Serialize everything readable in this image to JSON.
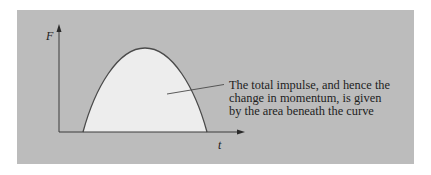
{
  "diagram": {
    "type": "force-time impulse curve",
    "axes": {
      "y_label": "F",
      "x_label": "t"
    },
    "curve": {
      "shape": "parabolic pulse",
      "start_x": 83,
      "peak": [
        145,
        48
      ],
      "end_x": 207,
      "baseline_y": 132
    },
    "annotation": {
      "lines": [
        "The total impulse, and hence the",
        "change in momentum, is given",
        "by the area beneath the curve"
      ]
    },
    "colors": {
      "background": "#bcbcbc",
      "area_fill": "#ededed",
      "curve_stroke": "#4a4a4a",
      "axis_stroke": "#3a3a3a",
      "text": "#1e1e1e"
    }
  }
}
